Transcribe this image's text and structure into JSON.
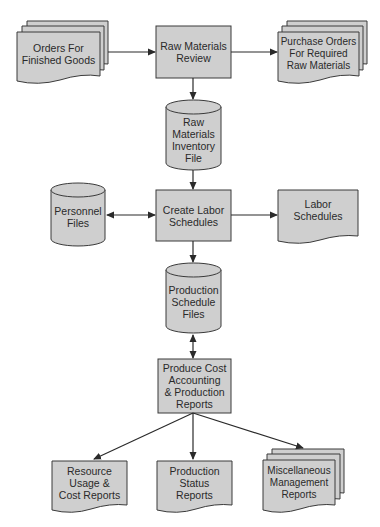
{
  "colors": {
    "fill": "#cfcfcf",
    "stroke": "#3a3a3a",
    "text": "#2a2a2a",
    "background": "#ffffff"
  },
  "nodes": {
    "orders": {
      "shape": "multi-document",
      "label": "Orders For\nFinished Goods"
    },
    "raw_review": {
      "shape": "process",
      "label": "Raw Materials\nReview"
    },
    "purchase_orders": {
      "shape": "multi-document",
      "label": "Purchase Orders\nFor Required\nRaw Materials"
    },
    "raw_inventory": {
      "shape": "database",
      "label": "Raw\nMaterials\nInventory\nFile"
    },
    "personnel": {
      "shape": "database",
      "label": "Personnel\nFiles"
    },
    "create_labor": {
      "shape": "process",
      "label": "Create Labor\nSchedules"
    },
    "labor_schedules": {
      "shape": "document",
      "label": "Labor\nSchedules"
    },
    "production_files": {
      "shape": "database",
      "label": "Production\nSchedule\nFiles"
    },
    "produce_cost": {
      "shape": "process",
      "label": "Produce Cost\nAccounting\n& Production\nReports"
    },
    "resource_usage": {
      "shape": "document",
      "label": "Resource\nUsage &\nCost Reports"
    },
    "production_status": {
      "shape": "document",
      "label": "Production\nStatus\nReports"
    },
    "misc_reports": {
      "shape": "multi-document",
      "label": "Miscellaneous\nManagement\nReports"
    }
  },
  "edges": [
    {
      "from": "orders",
      "to": "raw_review",
      "direction": "forward"
    },
    {
      "from": "raw_review",
      "to": "purchase_orders",
      "direction": "forward"
    },
    {
      "from": "raw_review",
      "to": "raw_inventory",
      "direction": "forward"
    },
    {
      "from": "raw_inventory",
      "to": "create_labor",
      "direction": "forward"
    },
    {
      "from": "personnel",
      "to": "create_labor",
      "direction": "both"
    },
    {
      "from": "create_labor",
      "to": "labor_schedules",
      "direction": "forward"
    },
    {
      "from": "create_labor",
      "to": "production_files",
      "direction": "forward"
    },
    {
      "from": "production_files",
      "to": "produce_cost",
      "direction": "both"
    },
    {
      "from": "produce_cost",
      "to": "resource_usage",
      "direction": "forward"
    },
    {
      "from": "produce_cost",
      "to": "production_status",
      "direction": "forward"
    },
    {
      "from": "produce_cost",
      "to": "misc_reports",
      "direction": "forward"
    }
  ]
}
